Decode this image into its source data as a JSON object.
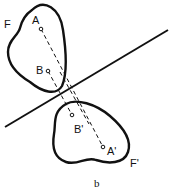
{
  "figure": {
    "caption": "b",
    "shape_original": {
      "label": "F",
      "points": [
        {
          "label": "A"
        },
        {
          "label": "B"
        }
      ]
    },
    "shape_image": {
      "label": "F'",
      "points": [
        {
          "label": "B'"
        },
        {
          "label": "A'"
        }
      ]
    },
    "mirror_line": {
      "style": "solid"
    },
    "connectors": {
      "style": "dashed"
    },
    "colors": {
      "stroke": "#111111",
      "background": "#ffffff"
    }
  }
}
